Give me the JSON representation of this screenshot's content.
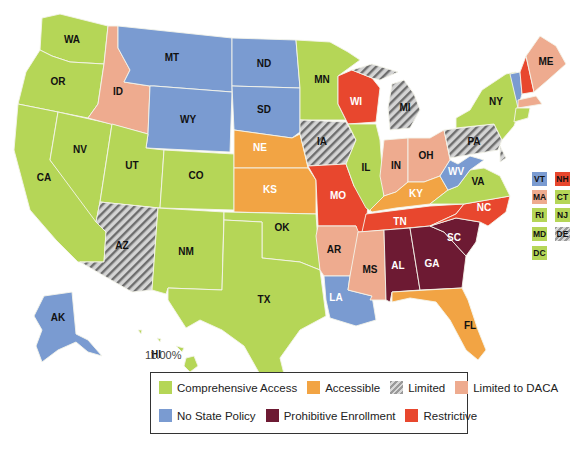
{
  "colors": {
    "comprehensive": "#b5d657",
    "accessible": "#f2a444",
    "limited": "#a9a9a9",
    "limited_daca": "#eeab8f",
    "no_policy": "#7a9bd1",
    "prohibitive": "#6d1a33",
    "restrictive": "#e8472e"
  },
  "legend": {
    "items": [
      {
        "key": "comprehensive",
        "label": "Comprehensive Access"
      },
      {
        "key": "accessible",
        "label": "Accessible"
      },
      {
        "key": "limited",
        "label": "Limited"
      },
      {
        "key": "limited_daca",
        "label": "Limited to DACA"
      },
      {
        "key": "no_policy",
        "label": "No State Policy"
      },
      {
        "key": "prohibitive",
        "label": "Prohibitive Enrollment"
      },
      {
        "key": "restrictive",
        "label": "Restrictive"
      }
    ]
  },
  "states": {
    "WA": "comprehensive",
    "OR": "comprehensive",
    "CA": "comprehensive",
    "NV": "comprehensive",
    "UT": "comprehensive",
    "CO": "comprehensive",
    "NM": "comprehensive",
    "TX": "comprehensive",
    "OK": "comprehensive",
    "MN": "comprehensive",
    "IL": "comprehensive",
    "NY": "comprehensive",
    "VA": "comprehensive",
    "HI": "comprehensive",
    "CT": "comprehensive",
    "RI": "comprehensive",
    "NJ": "comprehensive",
    "MD": "comprehensive",
    "DC": "comprehensive",
    "NE": "accessible",
    "KS": "accessible",
    "KY": "accessible",
    "FL": "accessible",
    "AZ": "limited",
    "IA": "limited",
    "MI": "limited",
    "PA": "limited",
    "DE": "limited",
    "ID": "limited_daca",
    "AR": "limited_daca",
    "MS": "limited_daca",
    "IN": "limited_daca",
    "OH": "limited_daca",
    "ME": "limited_daca",
    "MA": "limited_daca",
    "MT": "no_policy",
    "WY": "no_policy",
    "ND": "no_policy",
    "SD": "no_policy",
    "LA": "no_policy",
    "AK": "no_policy",
    "WV": "no_policy",
    "VT": "no_policy",
    "AL": "prohibitive",
    "GA": "prohibitive",
    "SC": "prohibitive",
    "WI": "restrictive",
    "MO": "restrictive",
    "TN": "restrictive",
    "NC": "restrictive",
    "NH": "restrictive"
  },
  "labels": {
    "WA": "WA",
    "OR": "OR",
    "CA": "CA",
    "NV": "NV",
    "ID": "ID",
    "MT": "MT",
    "WY": "WY",
    "UT": "UT",
    "CO": "CO",
    "AZ": "AZ",
    "NM": "NM",
    "TX": "TX",
    "OK": "OK",
    "KS": "KS",
    "NE": "NE",
    "SD": "SD",
    "ND": "ND",
    "MN": "MN",
    "IA": "IA",
    "MO": "MO",
    "AR": "AR",
    "LA": "LA",
    "WI": "WI",
    "IL": "IL",
    "MI": "MI",
    "IN": "IN",
    "OH": "OH",
    "KY": "KY",
    "TN": "TN",
    "MS": "MS",
    "AL": "AL",
    "GA": "GA",
    "FL": "FL",
    "SC": "SC",
    "NC": "NC",
    "VA": "VA",
    "WV": "WV",
    "PA": "PA",
    "NY": "NY",
    "ME": "ME",
    "AK": "AK",
    "HI": "HI"
  },
  "hawaii_value": "11.00%",
  "side_boxes": [
    {
      "code": "VT"
    },
    {
      "code": "NH"
    },
    {
      "code": "MA"
    },
    {
      "code": "CT"
    },
    {
      "code": "RI"
    },
    {
      "code": "NJ"
    },
    {
      "code": "MD"
    },
    {
      "code": "DE"
    },
    {
      "code": "DC"
    }
  ]
}
